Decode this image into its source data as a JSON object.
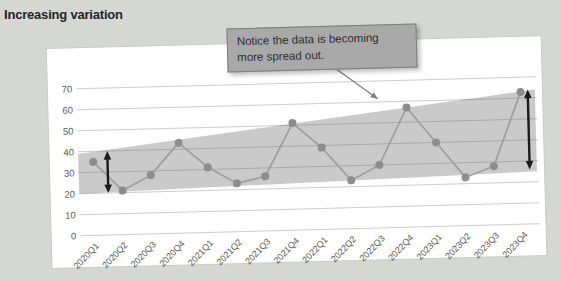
{
  "chart_data": {
    "type": "line",
    "title": "Increasing variation",
    "xlabel": "",
    "ylabel": "",
    "categories": [
      "2020Q1",
      "2020Q2",
      "2020Q3",
      "2020Q4",
      "2021Q1",
      "2021Q2",
      "2021Q3",
      "2021Q4",
      "2022Q1",
      "2022Q2",
      "2022Q3",
      "2022Q4",
      "2023Q1",
      "2023Q2",
      "2023Q3",
      "2023Q4"
    ],
    "values": [
      35,
      21,
      28,
      43,
      31,
      23,
      26,
      51,
      39,
      23,
      30,
      57,
      40,
      23,
      28,
      63
    ],
    "yticks": [
      0,
      10,
      20,
      30,
      40,
      50,
      60,
      70
    ],
    "ylim": [
      0,
      70
    ],
    "grid": "horizontal",
    "legend": "none",
    "band": {
      "start_index": -0.52,
      "end_index": 15.5,
      "left_top": 39,
      "left_bottom": 20,
      "right_top": 64,
      "right_bottom": 25
    },
    "spread_arrows": [
      {
        "index": 0.5,
        "min": 20,
        "max": 40
      },
      {
        "index": 15.25,
        "min": 26,
        "max": 64
      }
    ],
    "annotation": {
      "text": "Notice the data is becoming more spread out.",
      "arrow_from": {
        "index": 8.6,
        "value": 76
      },
      "arrow_to": {
        "index": 10.0,
        "value": 61.5
      }
    },
    "colors": {
      "background": "#d5d7d2",
      "card": "#ffffff",
      "card_edge": "#c9cbc6",
      "band": "rgba(138,138,138,0.45)",
      "gridline": "rgba(110,110,110,0.35)",
      "line": "#9c9c9c",
      "marker": "#8d8d8d",
      "axis_text": "#595959",
      "spread_arrow": "#1a1a1a",
      "callout_bg": "#a9a9a9",
      "callout_text": "#2e2e2e",
      "leader": "#7f7f7f",
      "title_text": "#23252c"
    }
  }
}
